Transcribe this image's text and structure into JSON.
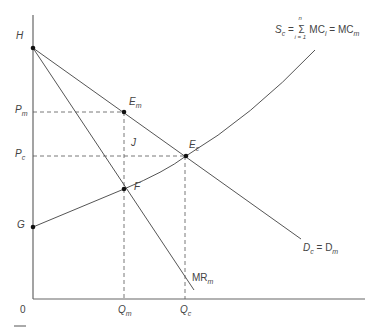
{
  "diagram": {
    "type": "economics-supply-demand",
    "points": {
      "H": {
        "label": "H",
        "x": 33,
        "y": 48
      },
      "Em": {
        "label": "E",
        "sub": "m",
        "x": 124,
        "y": 112
      },
      "Ec": {
        "label": "E",
        "sub": "c",
        "x": 186,
        "y": 156
      },
      "F": {
        "label": "F",
        "x": 124,
        "y": 189
      },
      "G": {
        "label": "G",
        "x": 33,
        "y": 227
      },
      "J": {
        "label": "J"
      }
    },
    "axis_labels": {
      "origin": "0",
      "Pm": {
        "label": "P",
        "sub": "m"
      },
      "Pc": {
        "label": "P",
        "sub": "c"
      },
      "Qm": {
        "label": "Q",
        "sub": "m"
      },
      "Qc": {
        "label": "Q",
        "sub": "c"
      }
    },
    "curves": {
      "supply": {
        "label_main": "S",
        "label_sub": "c",
        "eq": "= ",
        "sum_top": "n",
        "sum_bottom": "i = 1",
        "mc_i": "MC",
        "mc_i_sub": "i",
        "eq2": " = MC",
        "mc_m_sub": "m"
      },
      "demand": {
        "label": "D",
        "sub": "c",
        "eq": " = D",
        "sub2": "m"
      },
      "mr": {
        "label": "MR",
        "sub": "m"
      }
    },
    "colors": {
      "line": "#555555",
      "dash": "#555555",
      "point": "#111111"
    }
  }
}
